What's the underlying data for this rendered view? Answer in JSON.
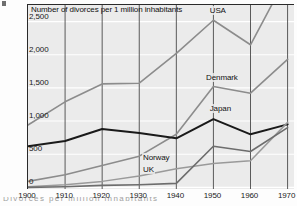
{
  "figure": {
    "marker": "4",
    "axis_title": "Number of divorces per 1 million inhabitants",
    "caption_fragment": "Divorces per million inhabitants"
  },
  "chart_data": {
    "type": "line",
    "title": "Number of divorces per 1 million inhabitants",
    "xlabel": "",
    "ylabel": "Number of divorces per 1 million inhabitants",
    "x": [
      1900,
      1910,
      1920,
      1930,
      1940,
      1950,
      1960,
      1970
    ],
    "xlim": [
      1900,
      1972
    ],
    "ylim": [
      -40,
      2750
    ],
    "yticks": [
      0,
      500,
      1000,
      1500,
      2000,
      2500
    ],
    "ytick_labels": [
      "0",
      "500",
      "1,000",
      "1,500",
      "2,000",
      "2,500"
    ],
    "xtick_labels": [
      "1900",
      "1910",
      "1920",
      "1930",
      "1940",
      "1950",
      "1960",
      "1970"
    ],
    "grid": "both",
    "legend": "inline-labels",
    "series": [
      {
        "name": "USA",
        "color": "#8c8c8c",
        "width": 1.6,
        "label_x": 1949,
        "label_y": 2640,
        "values": [
          940,
          1290,
          1560,
          1570,
          2020,
          2520,
          2150,
          3200
        ]
      },
      {
        "name": "Denmark",
        "color": "#8c8c8c",
        "width": 1.6,
        "label_x": 1948,
        "label_y": 1640,
        "values": [
          90,
          190,
          330,
          470,
          800,
          1520,
          1420,
          1930
        ]
      },
      {
        "name": "Japan",
        "color": "#1a1a1a",
        "width": 2.0,
        "label_x": 1949,
        "label_y": 1160,
        "values": [
          620,
          700,
          880,
          820,
          740,
          1030,
          800,
          950
        ]
      },
      {
        "name": "Norway",
        "color": "#9a9a9a",
        "width": 1.5,
        "label_x": 1931,
        "label_y": 430,
        "values": [
          10,
          40,
          90,
          170,
          280,
          360,
          400,
          980
        ]
      },
      {
        "name": "UK",
        "color": "#6d6d6d",
        "width": 1.6,
        "label_x": 1931,
        "label_y": 245,
        "values": [
          0,
          10,
          30,
          40,
          60,
          620,
          540,
          900
        ]
      }
    ]
  }
}
